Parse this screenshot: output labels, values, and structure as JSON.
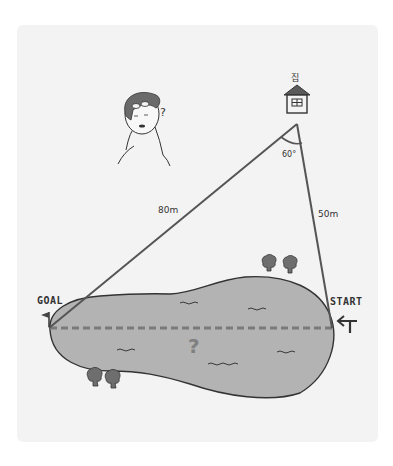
{
  "diagram": {
    "type": "distance-problem",
    "labels": {
      "house": "집",
      "angle": "60°",
      "distance_goal": "80m",
      "distance_start": "50m",
      "goal": "GOAL",
      "start": "START",
      "unknown": "?",
      "person_question": "?"
    },
    "geometry": {
      "apex": [
        297,
        124
      ],
      "goal_point": [
        49,
        328
      ],
      "start_point": [
        332,
        328
      ],
      "angle_deg": 60,
      "side_goal_m": 80,
      "side_start_m": 50
    },
    "colors": {
      "background_panel": "#f3f3f3",
      "lake_fill": "#b3b3b3",
      "line": "#555555",
      "dashed_line": "#7a7a7a",
      "question_mark": "#808080",
      "tree_fill": "#6e6e6e",
      "roof": "#5a5a5a",
      "hair": "#6a6a6a"
    },
    "icons": [
      "house-icon",
      "person-icon",
      "goal-flag-icon",
      "start-arrow-sign-icon",
      "tree-icon"
    ]
  }
}
